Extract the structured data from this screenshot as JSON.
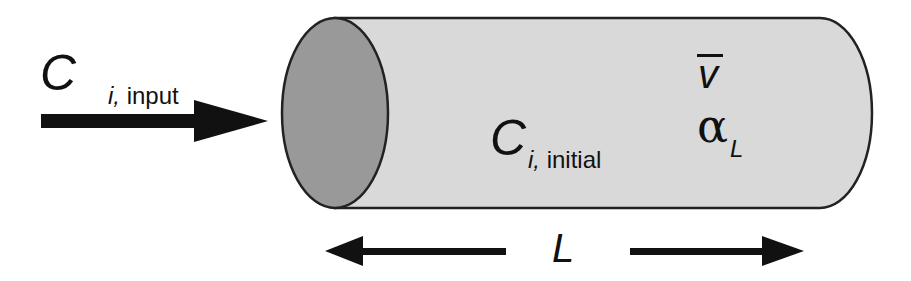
{
  "diagram": {
    "type": "column-transport-schematic",
    "colors": {
      "column_fill": "#d9d9d9",
      "end_cap_fill": "#999999",
      "outline": "#222222",
      "arrow": "#111111"
    },
    "input": {
      "symbol": "C",
      "subscript_var": "i,",
      "subscript_text": "input"
    },
    "column": {
      "initial": {
        "symbol": "C",
        "subscript_var": "i,",
        "subscript_text": "initial"
      },
      "velocity": {
        "symbol": "v",
        "overbar": true
      },
      "dispersivity": {
        "symbol": "α",
        "subscript": "L"
      }
    },
    "length": {
      "symbol": "L"
    }
  }
}
